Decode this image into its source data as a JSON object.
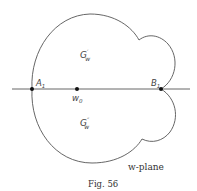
{
  "figure": {
    "caption": "Fig. 56",
    "plane_label": "w-plane",
    "points": {
      "A1": "A",
      "A1_sub": "1",
      "B1": "B",
      "B1_sub": "1",
      "w0": "w",
      "w0_sub": "0"
    },
    "regions": {
      "upper": "G",
      "upper_sup": "′",
      "upper_sub": "w",
      "lower": "G",
      "lower_sup": "″",
      "lower_sub": "w"
    },
    "colors": {
      "stroke": "#555555",
      "dot": "#111111",
      "text": "#444444"
    }
  }
}
